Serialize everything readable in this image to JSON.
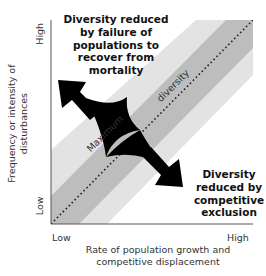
{
  "diagram": {
    "axes": {
      "x": {
        "label_line1": "Rate of population growth and",
        "label_line2": "competitive displacement",
        "low": "Low",
        "high": "High"
      },
      "y": {
        "label_line1": "Frequency or intensity of",
        "label_line2": "disturbances",
        "low": "Low",
        "high": "High"
      }
    },
    "band_label_left": "Maximum",
    "band_label_right": "diversity",
    "annotations": {
      "top_left": [
        "Diversity reduced",
        "by failure of",
        "populations to",
        "recover from",
        "mortality"
      ],
      "bottom_right": [
        "Diversity",
        "reduced by",
        "competitive",
        "exclusion"
      ]
    },
    "colors": {
      "outer_band": "#e3e3e3",
      "inner_band": "#bdbdbd",
      "arrow": "#000000",
      "axis": "#555555",
      "dotted_line": "#222222"
    }
  }
}
